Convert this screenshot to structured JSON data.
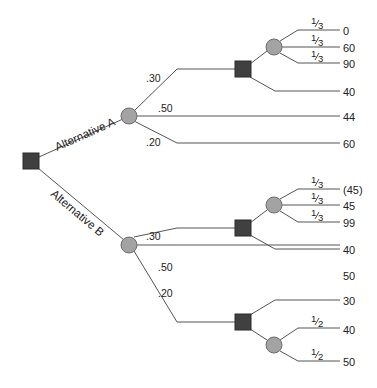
{
  "diagram": {
    "type": "decision-tree",
    "alternatives": {
      "A": {
        "label": "Alternative A"
      },
      "B": {
        "label": "Alternative B"
      }
    },
    "branch_probabilities": {
      "A_030": ".30",
      "A_050": ".50",
      "A_020": ".20",
      "B_030": ".30",
      "B_050": ".50",
      "B_020": ".20"
    },
    "fractions": {
      "one_third": {
        "num": "1",
        "den": "3"
      },
      "one_half": {
        "num": "1",
        "den": "2"
      }
    },
    "payoffs": {
      "A1_c1": "0",
      "A1_c2": "60",
      "A1_c3": "90",
      "A1_d": "40",
      "A_050": "44",
      "A_020": "60",
      "B1_c1": "(45)",
      "B1_c2": "45",
      "B1_c3": "99",
      "B1_d": "40",
      "B_050": "50",
      "B2_d": "30",
      "B2_c1": "40",
      "B2_c2": "50"
    },
    "colors": {
      "decision_node": "#404040",
      "chance_node": "#a3a3a3",
      "edge": "#555555"
    }
  }
}
